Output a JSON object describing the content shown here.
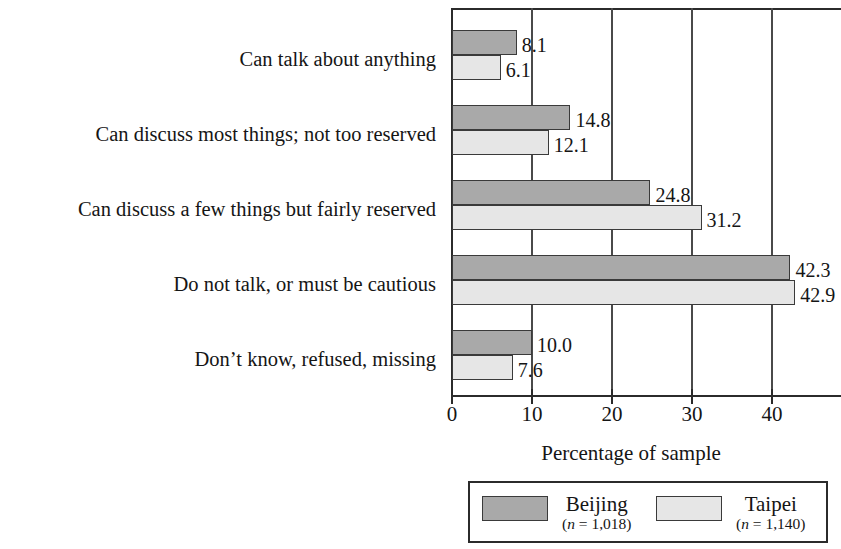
{
  "chart_data": {
    "type": "bar",
    "orientation": "horizontal",
    "title": "",
    "xlabel": "Percentage of sample",
    "ylabel": "",
    "xlim": [
      0,
      48.75
    ],
    "xticks": [
      0,
      10,
      20,
      30,
      40
    ],
    "xtick_labels": [
      "0",
      "10",
      "20",
      "30",
      "40"
    ],
    "grid": "vertical",
    "legend_position": "bottom",
    "categories": [
      "Can talk about anything",
      "Can discuss most things; not too reserved",
      "Can discuss a few things but fairly reserved",
      "Do not talk, or must be cautious",
      "Don’t know, refused, missing"
    ],
    "series": [
      {
        "name": "Beijing",
        "n_label": "(n = 1,018)",
        "n": 1018,
        "color": "#a9a9a9",
        "values": [
          8.1,
          14.8,
          24.8,
          42.3,
          10.0
        ],
        "value_labels": [
          "8.1",
          "14.8",
          "24.8",
          "42.3",
          "10.0"
        ]
      },
      {
        "name": "Taipei",
        "n_label": "(n = 1,140)",
        "n": 1140,
        "color": "#e6e6e6",
        "values": [
          6.1,
          12.1,
          31.2,
          42.9,
          7.6
        ],
        "value_labels": [
          "6.1",
          "12.1",
          "31.2",
          "42.9",
          "7.6"
        ]
      }
    ]
  },
  "legend": {
    "entries": [
      {
        "name": "Beijing",
        "n_label_prefix": "(",
        "n_label_var": "n",
        "n_label_suffix": " = 1,018)"
      },
      {
        "name": "Taipei",
        "n_label_prefix": "(",
        "n_label_var": "n",
        "n_label_suffix": " = 1,140)"
      }
    ]
  }
}
